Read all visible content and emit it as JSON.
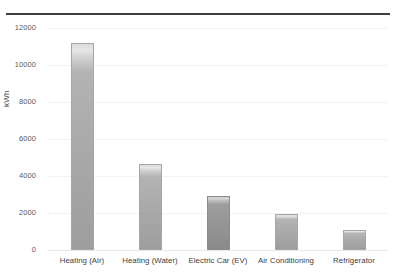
{
  "chart_data": {
    "type": "bar",
    "title": "",
    "subtitle": "",
    "xlabel": "",
    "ylabel": "kWh",
    "categories": [
      "Heating (Air)",
      "Heating (Water)",
      "Electric Car (EV)",
      "Air Conditioning",
      "Refrigerator"
    ],
    "values": [
      11200,
      4650,
      2900,
      1950,
      1100
    ],
    "ylim": [
      0,
      12000
    ],
    "yticks": [
      0,
      2000,
      4000,
      6000,
      8000,
      10000,
      12000
    ],
    "ytick_labels": [
      "0",
      "2000",
      "4000",
      "6000",
      "8000",
      "10000",
      "12000"
    ],
    "grid": true,
    "legend": "none",
    "bar_colors": [
      "#b0b0b0",
      "#b0b0b0",
      "#9a9a9a",
      "#b0b0b0",
      "#b0b0b0"
    ]
  },
  "style": {
    "top_rule_color": "#3f3f3f",
    "gridline_color": "#f2f2f2",
    "tick_text_color": "#595959",
    "axis_label_color": "#3f3f3f",
    "background": "#ffffff"
  }
}
